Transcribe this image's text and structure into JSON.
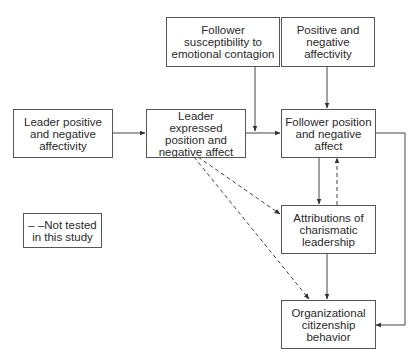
{
  "diagram": {
    "nodes": {
      "leader_affectivity": {
        "label": "Leader positive\nand negative\naffectivity"
      },
      "leader_expressed": {
        "label": "Leader expressed\nposition and\nnegative affect"
      },
      "follower_susceptibility": {
        "label": "Follower\nsusceptibility to\nemotional contagion"
      },
      "follower_affectivity": {
        "label": "Positive and\nnegative\naffectivity"
      },
      "follower_affect": {
        "label": "Follower position\nand negative\naffect"
      },
      "attributions": {
        "label": "Attributions of\ncharismatic\nleadership"
      },
      "ocb": {
        "label": "Organizational\ncitizenship\nbehavior"
      }
    },
    "legend": {
      "label": "– –Not tested\nin this study"
    },
    "edges": [
      {
        "from": "leader_affectivity",
        "to": "leader_expressed",
        "style": "solid"
      },
      {
        "from": "leader_expressed",
        "to": "follower_affect",
        "style": "solid"
      },
      {
        "from": "follower_susceptibility",
        "to": "leader_expressed->follower_affect",
        "style": "solid",
        "type": "moderator"
      },
      {
        "from": "follower_affectivity",
        "to": "follower_affect",
        "style": "solid"
      },
      {
        "from": "follower_affect",
        "to": "attributions",
        "style": "solid"
      },
      {
        "from": "attributions",
        "to": "follower_affect",
        "style": "dashed"
      },
      {
        "from": "attributions",
        "to": "ocb",
        "style": "solid"
      },
      {
        "from": "follower_affect",
        "to": "ocb",
        "style": "solid"
      },
      {
        "from": "leader_expressed",
        "to": "attributions",
        "style": "dashed"
      },
      {
        "from": "leader_expressed",
        "to": "ocb",
        "style": "dashed"
      }
    ]
  },
  "colors": {
    "line": "#444444",
    "border": "#555555",
    "text": "#2a2a2a",
    "background": "#ffffff"
  }
}
